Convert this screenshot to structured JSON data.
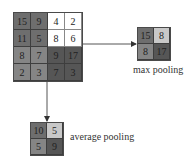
{
  "input_grid": {
    "rows": [
      [
        "15",
        "9",
        "4",
        "2"
      ],
      [
        "11",
        "5",
        "8",
        "6"
      ],
      [
        "8",
        "7",
        "9",
        "17"
      ],
      [
        "2",
        "3",
        "7",
        "3"
      ]
    ]
  },
  "max_pooling": {
    "label": "max pooling",
    "rows": [
      [
        "15",
        "8"
      ],
      [
        "8",
        "17"
      ]
    ]
  },
  "average_pooling": {
    "label": "average pooling",
    "rows": [
      [
        "10",
        "5"
      ],
      [
        "5",
        "9"
      ]
    ],
    "note": "bottom-right value (9) not legible in screenshot; inferred as mean of quadrant [9,17,7,3]"
  },
  "colors": {
    "quadrant_top_left": "#6e6e6e",
    "quadrant_top_right": "#ffffff",
    "quadrant_bottom_left": "#858585",
    "quadrant_bottom_right": "#565656",
    "arrow": "#555555"
  }
}
